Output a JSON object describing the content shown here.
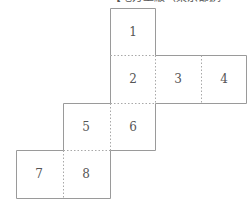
{
  "header": {
    "left_text": "・・",
    "middle_text": "【地方上級（東京都）",
    "right_text": "例"
  },
  "diagram": {
    "type": "cube-net",
    "line_color": "#999999",
    "number_color": "#555555",
    "cells": [
      {
        "label": "1",
        "col": 2,
        "row": 0
      },
      {
        "label": "2",
        "col": 2,
        "row": 1
      },
      {
        "label": "3",
        "col": 3,
        "row": 1
      },
      {
        "label": "4",
        "col": 4,
        "row": 1
      },
      {
        "label": "5",
        "col": 1,
        "row": 2
      },
      {
        "label": "6",
        "col": 2,
        "row": 2
      },
      {
        "label": "7",
        "col": 0,
        "row": 3
      },
      {
        "label": "8",
        "col": 1,
        "row": 3
      }
    ]
  }
}
